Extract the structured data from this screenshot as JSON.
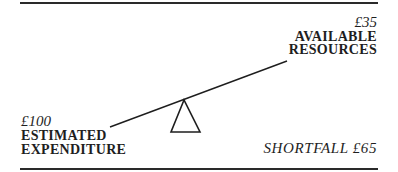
{
  "diagram": {
    "type": "seesaw-balance",
    "right_side": {
      "amount": "£35",
      "label_line1": "AVAILABLE",
      "label_line2": "RESOURCES"
    },
    "left_side": {
      "amount": "£100",
      "label_line1": "ESTIMATED",
      "label_line2": "EXPENDITURE"
    },
    "shortfall": "SHORTFALL £65"
  },
  "colors": {
    "ink": "#1e1e1e",
    "background": "#ffffff"
  }
}
